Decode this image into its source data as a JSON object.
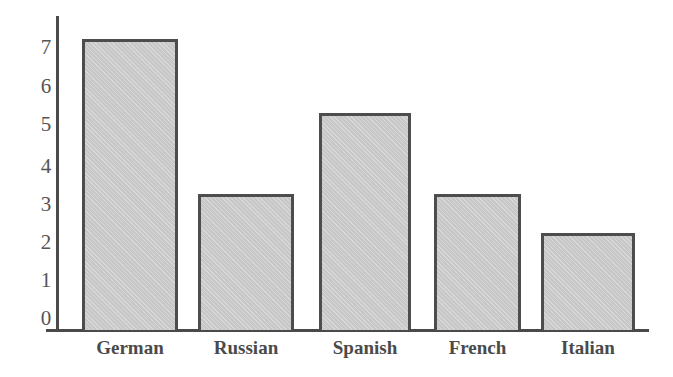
{
  "chart_data": {
    "type": "bar",
    "title": "",
    "xlabel": "",
    "ylabel": "",
    "categories": [
      "German",
      "Russian",
      "Spanish",
      "French",
      "Italian"
    ],
    "values": [
      7.2,
      3.2,
      5.3,
      3.2,
      2.2
    ],
    "ylim": [
      0,
      7.5
    ],
    "yticks": [
      "0",
      "1",
      "2",
      "3",
      "4",
      "5",
      "6",
      "7"
    ],
    "grid": false,
    "legend": null,
    "colors": {
      "bar_fill": "#cfcfcf",
      "bar_edge": "#4d4d4d",
      "axis": "#4a4a4a",
      "text": "#4a4a4a"
    }
  }
}
